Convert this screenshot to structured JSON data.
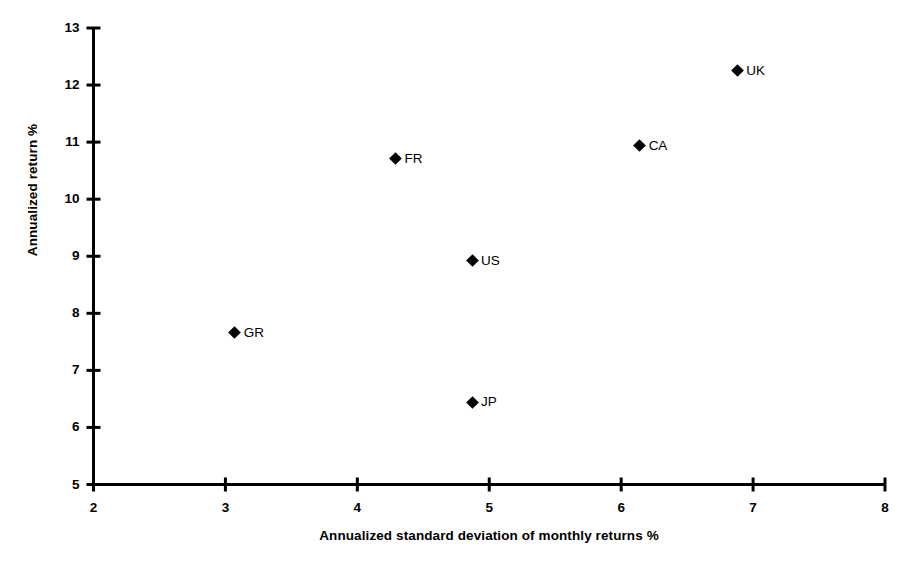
{
  "chart_data": {
    "type": "scatter",
    "title": "",
    "xlabel": "Annualized standard deviation of monthly returns %",
    "ylabel": "Annualized return %",
    "xlim": [
      2,
      8
    ],
    "ylim": [
      5,
      13
    ],
    "xticks": [
      "2",
      "3",
      "4",
      "5",
      "6",
      "7",
      "8"
    ],
    "yticks": [
      "5",
      "6",
      "7",
      "8",
      "9",
      "10",
      "11",
      "12",
      "13"
    ],
    "grid": false,
    "legend": "none",
    "marker": "filled-diamond",
    "marker_color": "#000000",
    "points": [
      {
        "label": "GR",
        "x": 3.07,
        "y": 7.66
      },
      {
        "label": "FR",
        "x": 4.29,
        "y": 10.71
      },
      {
        "label": "JP",
        "x": 4.87,
        "y": 6.44
      },
      {
        "label": "US",
        "x": 4.87,
        "y": 8.92
      },
      {
        "label": "CA",
        "x": 6.14,
        "y": 10.94
      },
      {
        "label": "UK",
        "x": 6.88,
        "y": 12.25
      }
    ]
  },
  "axes": {
    "x_title": "Annualized standard deviation of monthly returns %",
    "y_title": "Annualized return %"
  }
}
